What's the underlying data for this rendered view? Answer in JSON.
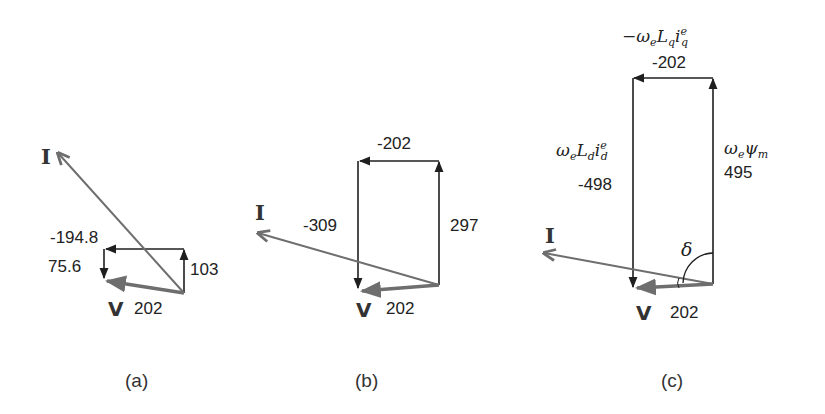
{
  "figure": {
    "panels": [
      {
        "id": "a",
        "caption": "(a)",
        "current_label": "I",
        "voltage_label": "V",
        "voltage_magnitude": "202",
        "values": {
          "horizontal": "-194.8",
          "vertical_up": "103",
          "vertical_down": "75.6"
        }
      },
      {
        "id": "b",
        "caption": "(b)",
        "current_label": "I",
        "voltage_label": "V",
        "voltage_magnitude": "202",
        "values": {
          "horizontal": "-202",
          "vertical_up": "297",
          "vertical_down": "-309"
        }
      },
      {
        "id": "c",
        "caption": "(c)",
        "current_label": "I",
        "voltage_label": "V",
        "voltage_magnitude": "202",
        "angle_label": "δ",
        "values": {
          "horizontal": "-202",
          "vertical_up": "495",
          "vertical_down": "-498"
        },
        "symbols": {
          "horizontal": {
            "prefix": "−ω",
            "sub1": "e",
            "mid": "L",
            "sub2": "q",
            "var": "i",
            "sup3": "e",
            "sub3": "q"
          },
          "vertical_up": {
            "prefix": "ω",
            "sub1": "e",
            "mid": "ψ",
            "sub2": "m"
          },
          "vertical_down": {
            "prefix": "ω",
            "sub1": "e",
            "mid": "L",
            "sub2": "d",
            "var": "i",
            "sup3": "e",
            "sub3": "d"
          }
        }
      }
    ],
    "colors": {
      "black_vector": "#1f1f1f",
      "gray_vector": "#6e6e6e"
    }
  }
}
